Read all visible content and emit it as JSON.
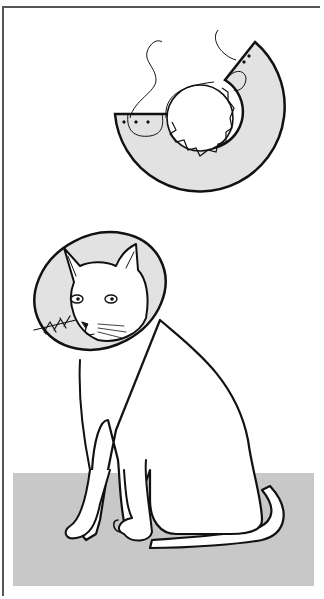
{
  "illustration": {
    "subject": "Cat wearing an Elizabethan collar",
    "parts": {
      "collar_pattern": "Flat cutout pattern of the cone collar with tabs and ties",
      "cat": "Seated cat wearing the assembled cone collar",
      "floor": "Gray floor panel"
    }
  },
  "colors": {
    "background": "#ffffff",
    "collar_fill": "#e2e2e2",
    "floor": "#c8c8c8",
    "line": "#111111",
    "frame": "#555555"
  }
}
